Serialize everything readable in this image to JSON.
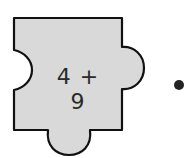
{
  "puzzle_piece": {
    "expression": "4 + 9",
    "fill_color": "#d9d9d9",
    "outline_color": "#111111"
  },
  "match_dot": {
    "color": "#222222"
  }
}
